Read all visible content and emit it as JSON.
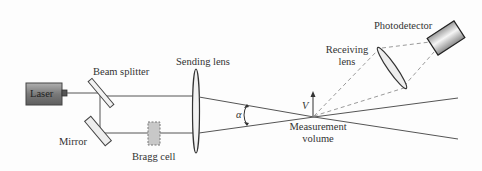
{
  "diagram": {
    "labels": {
      "laser": "Laser",
      "beam_splitter": "Beam splitter",
      "mirror": "Mirror",
      "bragg_cell": "Bragg cell",
      "sending_lens": "Sending lens",
      "alpha": "α",
      "velocity": "V",
      "measurement_volume_line1": "Measurement",
      "measurement_volume_line2": "volume",
      "receiving_lens_line1": "Receiving",
      "receiving_lens_line2": "lens",
      "photodetector": "Photodetector"
    },
    "colors": {
      "line": "#555555",
      "laser_body": "#8a8a8a",
      "bragg_cell_fill": "#c8c8c8",
      "lens_fill": "#f2f2f2",
      "dashed": "#9a9a9a"
    }
  }
}
